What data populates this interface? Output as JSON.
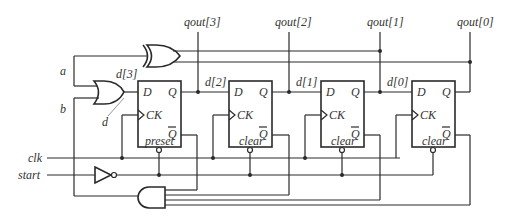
{
  "diagram": {
    "outputs": {
      "qout3": "qout[3]",
      "qout2": "qout[2]",
      "qout1": "qout[1]",
      "qout0": "qout[0]"
    },
    "internal_signals": {
      "d3": "d[3]",
      "d2": "d[2]",
      "d1": "d[1]",
      "d0": "d[0]",
      "a": "a",
      "b": "b",
      "d": "d"
    },
    "inputs": {
      "clk": "clk",
      "start": "start"
    },
    "flip_flops": [
      {
        "id": "ff3",
        "d_label": "D",
        "q_label": "Q",
        "ck_label": "CK",
        "qbar_label": "Q",
        "async_label": "preset"
      },
      {
        "id": "ff2",
        "d_label": "D",
        "q_label": "Q",
        "ck_label": "CK",
        "qbar_label": "Q",
        "async_label": "clear"
      },
      {
        "id": "ff1",
        "d_label": "D",
        "q_label": "Q",
        "ck_label": "CK",
        "qbar_label": "Q",
        "async_label": "clear"
      },
      {
        "id": "ff0",
        "d_label": "D",
        "q_label": "Q",
        "ck_label": "CK",
        "qbar_label": "Q",
        "async_label": "clear"
      }
    ],
    "gates": [
      "xor",
      "or",
      "not",
      "and"
    ]
  }
}
